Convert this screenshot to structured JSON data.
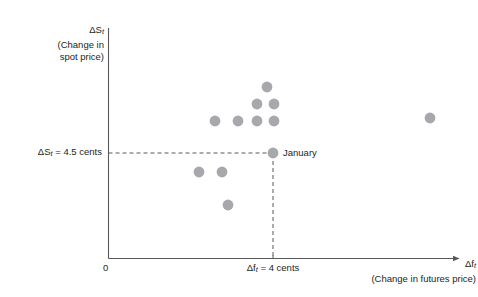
{
  "figure": {
    "background_color": "#ffffff",
    "axis_color": "#58595b",
    "point_color": "#a6a8ab",
    "text_color": "#231f20",
    "dash_color": "#58595b"
  },
  "axes": {
    "origin_label": "0",
    "y_title_line1": "ΔS",
    "y_title_line1_sub": "t",
    "y_title_line2": "(Change in",
    "y_title_line3": "spot price)",
    "y_threshold_label": "ΔS",
    "y_threshold_sub": "t",
    "y_threshold_value": " = 4.5 cents",
    "x_tick_label": "Δf",
    "x_tick_sub": "t",
    "x_tick_value": " = 4 cents",
    "x_title_line1": "Δf",
    "x_title_line1_sub": "t",
    "x_title_line2": "(Change in futures price)"
  },
  "annotations": {
    "january_label": "January"
  },
  "chart_data": {
    "type": "scatter",
    "title": "",
    "xlabel": "Δf_t (Change in futures price)",
    "ylabel": "ΔS_t (Change in spot price)",
    "xlim": [
      0,
      8
    ],
    "ylim": [
      0,
      10.3
    ],
    "grid": false,
    "legend": null,
    "reference_lines": [
      {
        "name": "spot-price-threshold",
        "orientation": "horizontal",
        "value": 4.5,
        "label": "ΔS_t = 4.5 cents",
        "style": "dashed"
      },
      {
        "name": "futures-price-threshold",
        "orientation": "vertical",
        "value": 4.0,
        "label": "Δf_t = 4 cents",
        "style": "dashed"
      }
    ],
    "series": [
      {
        "name": "monthly-observations",
        "marker": "circle",
        "color": "#a6a8ab",
        "points": [
          {
            "x": 3.84,
            "y": 7.65,
            "px": 267,
            "py": 87,
            "label": ""
          },
          {
            "x": 3.62,
            "y": 6.89,
            "px": 257,
            "py": 104,
            "label": ""
          },
          {
            "x": 4.02,
            "y": 6.89,
            "px": 274,
            "py": 104,
            "label": ""
          },
          {
            "x": 2.7,
            "y": 6.13,
            "px": 215,
            "py": 121,
            "label": ""
          },
          {
            "x": 3.22,
            "y": 6.13,
            "px": 238,
            "py": 121,
            "label": ""
          },
          {
            "x": 3.62,
            "y": 6.13,
            "px": 257,
            "py": 121,
            "label": ""
          },
          {
            "x": 4.02,
            "y": 6.13,
            "px": 274,
            "py": 121,
            "label": ""
          },
          {
            "x": 7.22,
            "y": 6.26,
            "px": 430,
            "py": 118,
            "label": ""
          },
          {
            "x": 4.0,
            "y": 4.5,
            "px": 273,
            "py": 153,
            "label": "January"
          },
          {
            "x": 2.34,
            "y": 3.65,
            "px": 199,
            "py": 172,
            "label": ""
          },
          {
            "x": 2.86,
            "y": 3.65,
            "px": 222,
            "py": 172,
            "label": ""
          },
          {
            "x": 2.99,
            "y": 2.32,
            "px": 228,
            "py": 205,
            "label": ""
          }
        ]
      }
    ],
    "point_count": 12,
    "highlighted_point": {
      "name": "January",
      "x": 4.0,
      "y": 4.5
    }
  }
}
